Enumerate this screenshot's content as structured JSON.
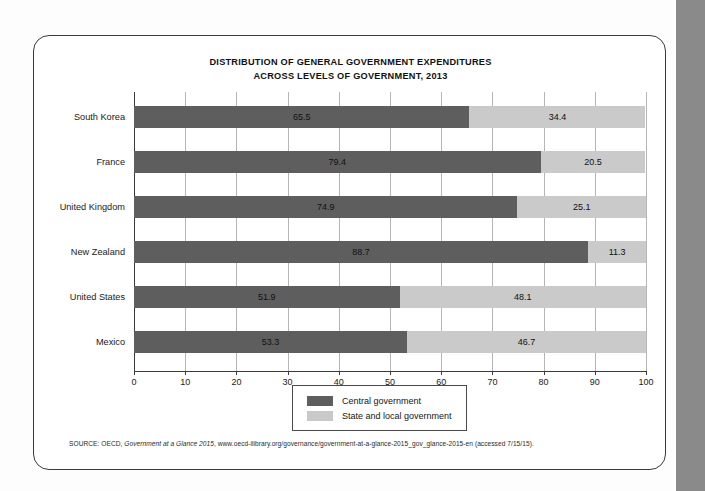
{
  "chart_data": {
    "type": "bar",
    "orientation": "horizontal",
    "stacked": true,
    "stacked_100": true,
    "title_line1": "DISTRIBUTION OF GENERAL GOVERNMENT EXPENDITURES",
    "title_line2": "ACROSS LEVELS OF GOVERNMENT, 2013",
    "title": "DISTRIBUTION OF GENERAL GOVERNMENT EXPENDITURES ACROSS LEVELS OF GOVERNMENT, 2013",
    "xlabel": "",
    "ylabel": "",
    "xlim": [
      0,
      100
    ],
    "xticks": [
      0,
      10,
      20,
      30,
      40,
      50,
      60,
      70,
      80,
      90,
      100
    ],
    "xtick_labels": [
      "0",
      "10",
      "20",
      "30",
      "40",
      "50",
      "60",
      "70",
      "80",
      "90",
      "100"
    ],
    "grid": true,
    "grid_axis": "x",
    "legend_position": "bottom-center",
    "categories": [
      "South Korea",
      "France",
      "United Kingdom",
      "New Zealand",
      "United States",
      "Mexico"
    ],
    "series": [
      {
        "name": "Central government",
        "color": "#5e5e5e",
        "values": [
          65.5,
          79.4,
          74.9,
          88.7,
          51.9,
          53.3
        ]
      },
      {
        "name": "State and local government",
        "color": "#cacaca",
        "values": [
          34.4,
          20.5,
          25.1,
          11.3,
          48.1,
          46.7
        ]
      }
    ],
    "rows": [
      {
        "category": "South Korea",
        "central": 65.5,
        "state": 34.4,
        "central_label": "65.5",
        "state_label": "34.4"
      },
      {
        "category": "France",
        "central": 79.4,
        "state": 20.5,
        "central_label": "79.4",
        "state_label": "20.5"
      },
      {
        "category": "United Kingdom",
        "central": 74.9,
        "state": 25.1,
        "central_label": "74.9",
        "state_label": "25.1"
      },
      {
        "category": "New Zealand",
        "central": 88.7,
        "state": 11.3,
        "central_label": "88.7",
        "state_label": "11.3"
      },
      {
        "category": "United States",
        "central": 51.9,
        "state": 48.1,
        "central_label": "51.9",
        "state_label": "48.1"
      },
      {
        "category": "Mexico",
        "central": 53.3,
        "state": 46.7,
        "central_label": "53.3",
        "state_label": "46.7"
      }
    ]
  },
  "legend": {
    "items": [
      {
        "label": "Central government",
        "color": "#5e5e5e"
      },
      {
        "label": "State and local government",
        "color": "#cacaca"
      }
    ]
  },
  "source": {
    "prefix": "SOURCE: OECD, ",
    "italic": "Government at a Glance 2015",
    "suffix": ", www.oecd-ilibrary.org/governance/government-at-a-glance-2015_gov_glance-2015-en (accessed 7/15/15)."
  },
  "colors": {
    "central": "#5e5e5e",
    "state": "#cacaca",
    "gridline": "#b6b6b6",
    "axis": "#3a3a3a",
    "frame_border": "#3a3a3a",
    "page_edge_strip": "#8a8a8a",
    "background": "#ffffff"
  }
}
